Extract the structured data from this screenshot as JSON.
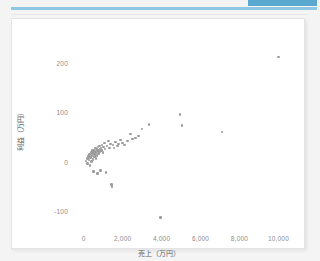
{
  "page": {
    "background_color": "#f4f4f4",
    "accent_color": "#8ec6e3",
    "chip_color": "#59a8d0"
  },
  "card": {
    "background_color": "#ffffff",
    "border_color": "#e4e4e4"
  },
  "chart_data": {
    "type": "scatter",
    "title": "",
    "xlabel": "売上（万円）",
    "ylabel": "利益（万円）",
    "xlim": [
      -500,
      10800
    ],
    "ylim": [
      -135,
      235
    ],
    "xticks": [
      0,
      2000,
      4000,
      6000,
      8000,
      10000
    ],
    "xticklabels": [
      "0",
      "2,000",
      "4,000",
      "6,000",
      "8,000",
      "10,000"
    ],
    "yticks": [
      -100,
      0,
      100,
      200
    ],
    "yticklabels": [
      "-100",
      "0",
      "100",
      "200"
    ],
    "grid": false,
    "legend": null,
    "marker_color": "#9b9b9b",
    "marker_size": 2.6,
    "series": [
      {
        "name": "店舗",
        "points": [
          [
            120,
            3
          ],
          [
            180,
            8
          ],
          [
            200,
            -2
          ],
          [
            240,
            12
          ],
          [
            280,
            5
          ],
          [
            310,
            16
          ],
          [
            330,
            -6
          ],
          [
            360,
            10
          ],
          [
            390,
            20
          ],
          [
            410,
            2
          ],
          [
            430,
            14
          ],
          [
            450,
            24
          ],
          [
            470,
            6
          ],
          [
            490,
            18
          ],
          [
            500,
            -18
          ],
          [
            520,
            26
          ],
          [
            540,
            12
          ],
          [
            560,
            22
          ],
          [
            580,
            16
          ],
          [
            600,
            30
          ],
          [
            620,
            8
          ],
          [
            640,
            20
          ],
          [
            660,
            28
          ],
          [
            680,
            14
          ],
          [
            700,
            24
          ],
          [
            720,
            -22
          ],
          [
            740,
            32
          ],
          [
            760,
            18
          ],
          [
            780,
            26
          ],
          [
            800,
            22
          ],
          [
            820,
            34
          ],
          [
            840,
            28
          ],
          [
            860,
            -16
          ],
          [
            880,
            30
          ],
          [
            900,
            24
          ],
          [
            940,
            36
          ],
          [
            980,
            20
          ],
          [
            1020,
            32
          ],
          [
            1060,
            40
          ],
          [
            1100,
            28
          ],
          [
            1150,
            -20
          ],
          [
            1200,
            34
          ],
          [
            1260,
            44
          ],
          [
            1320,
            30
          ],
          [
            1380,
            38
          ],
          [
            1420,
            -45
          ],
          [
            1450,
            -48
          ],
          [
            1500,
            36
          ],
          [
            1560,
            30
          ],
          [
            1640,
            42
          ],
          [
            1720,
            34
          ],
          [
            1800,
            38
          ],
          [
            1900,
            46
          ],
          [
            2000,
            40
          ],
          [
            2100,
            36
          ],
          [
            2250,
            44
          ],
          [
            2400,
            58
          ],
          [
            2500,
            48
          ],
          [
            2650,
            50
          ],
          [
            2800,
            54
          ],
          [
            3000,
            68
          ],
          [
            3350,
            78
          ],
          [
            3950,
            -112
          ],
          [
            4950,
            98
          ],
          [
            5050,
            76
          ],
          [
            7100,
            62
          ],
          [
            10000,
            215
          ]
        ]
      }
    ]
  }
}
